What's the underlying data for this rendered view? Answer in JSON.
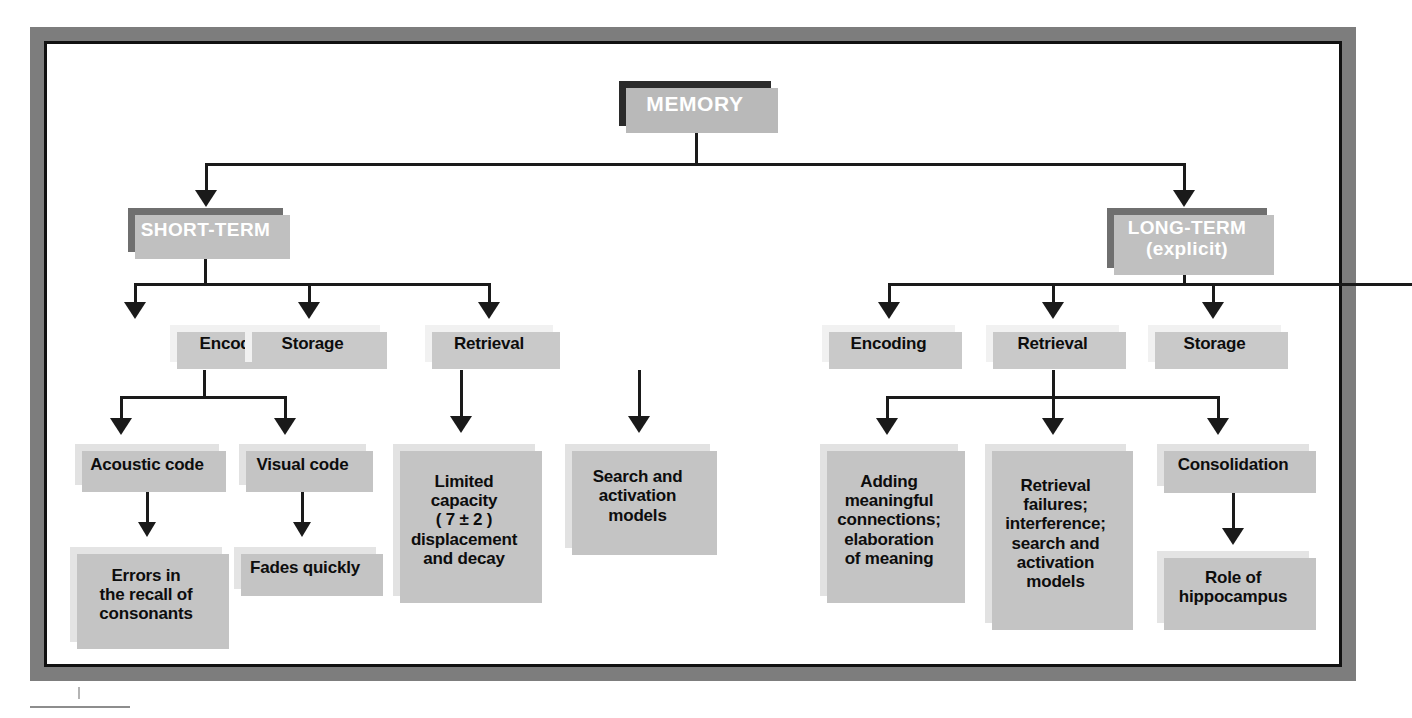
{
  "diagram": {
    "root": {
      "label": "MEMORY"
    },
    "branches": [
      {
        "name": "short-term",
        "label": "SHORT-TERM",
        "stages": [
          {
            "name": "st-encoding",
            "label": "Encoding"
          },
          {
            "name": "st-storage",
            "label": "Storage"
          },
          {
            "name": "st-retrieval",
            "label": "Retrieval"
          }
        ],
        "details": [
          {
            "name": "acoustic-code",
            "label": "Acoustic code"
          },
          {
            "name": "visual-code",
            "label": "Visual code"
          },
          {
            "name": "limited-capacity",
            "label": "Limited\ncapacity\n( 7 ± 2 )\ndisplacement\nand decay"
          },
          {
            "name": "st-search-activation",
            "label": "Search and\nactivation\nmodels"
          }
        ],
        "outcomes": [
          {
            "name": "errors-recall-consonants",
            "label": "Errors in\nthe recall of\nconsonants"
          },
          {
            "name": "fades-quickly",
            "label": "Fades quickly"
          }
        ]
      },
      {
        "name": "long-term",
        "label": "LONG-TERM\n(explicit)",
        "label_line1": "LONG-TERM",
        "label_line2": "(explicit)",
        "stages": [
          {
            "name": "lt-encoding",
            "label": "Encoding"
          },
          {
            "name": "lt-retrieval",
            "label": "Retrieval"
          },
          {
            "name": "lt-storage",
            "label": "Storage"
          }
        ],
        "details": [
          {
            "name": "adding-meaningful-connections",
            "label": "Adding\nmeaningful\nconnections;\nelaboration\nof meaning"
          },
          {
            "name": "retrieval-failures",
            "label": "Retrieval\nfailures;\ninterference;\nsearch and\nactivation\nmodels"
          },
          {
            "name": "consolidation",
            "label": "Consolidation"
          }
        ],
        "outcomes": [
          {
            "name": "role-of-hippocampus",
            "label": "Role of\nhippocampus"
          }
        ]
      }
    ]
  },
  "colors": {
    "root_box": "#2b2b2b",
    "branch_box": "#6f6f6f",
    "stage_box": "#f1f1f1",
    "detail_box": "#e2e2e2",
    "shadow": "#c4c4c4",
    "connector": "#1a1a1a",
    "frame": "#7d7d7d"
  }
}
